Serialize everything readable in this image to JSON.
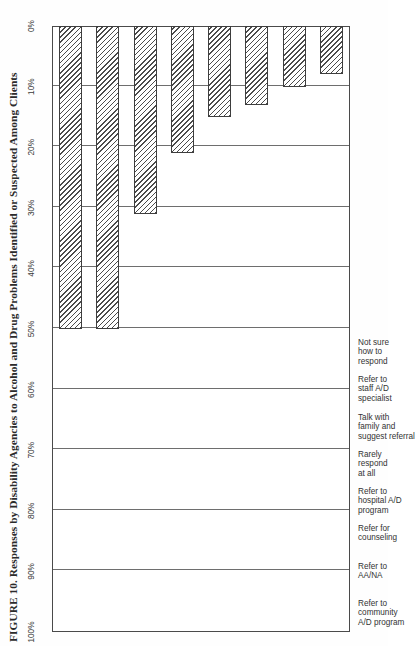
{
  "figure": {
    "title": "FIGURE 10. Responses by Disability Agencies to Alcohol and Drug Problems Identified or Suspected Among Clients"
  },
  "axis": {
    "value_axis_label": "",
    "ticks": [
      "100%",
      "90%",
      "80%",
      "70%",
      "60%",
      "50%",
      "40%",
      "30%",
      "20%",
      "10%",
      "0%"
    ]
  },
  "categories": [
    {
      "line1": "Refer to",
      "line2": "community",
      "line3": "A/D program"
    },
    {
      "line1": "Refer to",
      "line2": "AA/NA",
      "line3": ""
    },
    {
      "line1": "Refer for",
      "line2": "counseling",
      "line3": ""
    },
    {
      "line1": "Refer to",
      "line2": "hospital A/D",
      "line3": "program"
    },
    {
      "line1": "Rarely",
      "line2": "respond",
      "line3": "at all"
    },
    {
      "line1": "Talk with",
      "line2": "family and",
      "line3": "suggest referral"
    },
    {
      "line1": "Refer to",
      "line2": "staff A/D",
      "line3": "specialist"
    },
    {
      "line1": "Not sure",
      "line2": "how to",
      "line3": "respond"
    }
  ],
  "chart_data": {
    "type": "bar",
    "title": "FIGURE 10. Responses by Disability Agencies to Alcohol and Drug Problems Identified or Suspected Among Clients",
    "orientation": "vertical-bars-rotated-page",
    "xlabel": "",
    "ylabel": "",
    "ylim": [
      0,
      100
    ],
    "unit": "%",
    "grid": true,
    "legend": "none",
    "tick_step": 10,
    "categories": [
      "Refer to community A/D program",
      "Refer to AA/NA",
      "Refer for counseling",
      "Refer to hospital A/D program",
      "Rarely respond at all",
      "Talk with family and suggest referral",
      "Refer to staff A/D specialist",
      "Not sure how to respond"
    ],
    "values": [
      50,
      50,
      31,
      21,
      15,
      13,
      10,
      8
    ]
  },
  "style": {
    "bar_fill": "diagonal-hatch",
    "bar_outline": "#3d3d3d",
    "frame_color": "#4a4a4a",
    "grid_color": "#6e6e6e",
    "text_color": "#333333",
    "page_background": "#fefefe"
  }
}
